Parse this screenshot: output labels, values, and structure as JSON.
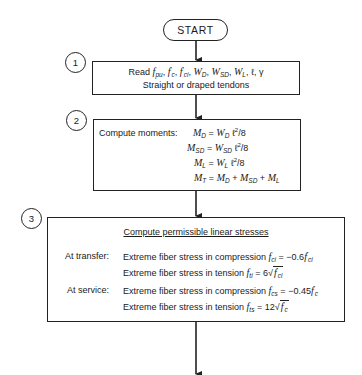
{
  "flowchart": {
    "start": {
      "label": "START"
    },
    "steps": [
      {
        "number": "1",
        "read_label": "Read",
        "variables": [
          "f_pu",
          "f'_c",
          "f'_ci",
          "W_D",
          "W_SD",
          "W_L",
          "ℓ",
          "γ"
        ],
        "line2": "Straight or draped tendons"
      },
      {
        "number": "2",
        "title": "Compute moments:",
        "equations": [
          "M_D = W_D ℓ²/8",
          "M_SD = W_SD ℓ²/8",
          "M_L = W_L ℓ²/8",
          "M_T = M_D + M_SD + M_L"
        ]
      },
      {
        "number": "3",
        "title": "Compute permissible linear stresses",
        "groups": [
          {
            "label": "At transfer:",
            "rows": [
              {
                "text": "Extreme fiber stress in compression",
                "formula": "f_ci = −0.6 f'_ci"
              },
              {
                "text": "Extreme fiber stress in tension",
                "formula": "f_ti = 6 √f'_ci"
              }
            ]
          },
          {
            "label": "At service:",
            "rows": [
              {
                "text": "Extreme fiber stress in compression",
                "formula": "f_cs = −0.45 f'_c"
              },
              {
                "text": "Extreme fiber stress in tension",
                "formula": "f_ts = 12 √f'_c"
              }
            ]
          }
        ]
      }
    ],
    "symbols": {
      "f": "f",
      "W": "W",
      "M": "M",
      "ell": "ℓ",
      "gamma": "γ",
      "eq": "=",
      "plus": "+",
      "sep": ",",
      "over8": "/8",
      "sq": "2",
      "neg06": "−0.6",
      "neg045": "−0.45",
      "six": "6",
      "twelve": "12",
      "prime": "′",
      "sqrt": "√",
      "sub_pu": "pu",
      "sub_c": "c",
      "sub_ci": "ci",
      "sub_D": "D",
      "sub_SD": "SD",
      "sub_L": "L",
      "sub_T": "T",
      "sub_ti": "ti",
      "sub_cs": "cs",
      "sub_ts": "ts"
    }
  }
}
